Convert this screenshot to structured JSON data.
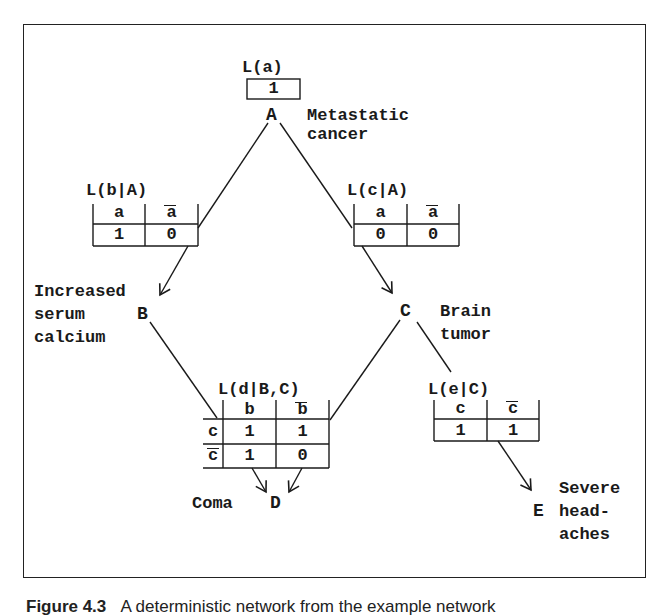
{
  "nodes": {
    "A": {
      "letter": "A",
      "label_lines": [
        "Metastatic",
        "cancer"
      ]
    },
    "B": {
      "letter": "B",
      "label_lines": [
        "Increased",
        "serum",
        "calcium"
      ]
    },
    "C": {
      "letter": "C",
      "label_lines": [
        "Brain",
        "tumor"
      ]
    },
    "D": {
      "letter": "D",
      "label_lines": [
        "Coma"
      ]
    },
    "E": {
      "letter": "E",
      "label_lines": [
        "Severe",
        "head-",
        "aches"
      ]
    }
  },
  "tables": {
    "La": {
      "title": "L(a)",
      "values": [
        "1"
      ]
    },
    "LbA": {
      "title": "L(b|A)",
      "headers": [
        "a",
        "a"
      ],
      "values": [
        "1",
        "0"
      ]
    },
    "LcA": {
      "title": "L(c|A)",
      "headers": [
        "a",
        "a"
      ],
      "values": [
        "0",
        "0"
      ]
    },
    "LdBC": {
      "title": "L(d|B,C)",
      "col_headers": [
        "b",
        "b"
      ],
      "rows": [
        {
          "row_header": "c",
          "values": [
            "1",
            "1"
          ]
        },
        {
          "row_header": "c",
          "values": [
            "1",
            "0"
          ]
        }
      ]
    },
    "LeC": {
      "title": "L(e|C)",
      "headers": [
        "c",
        "c"
      ],
      "values": [
        "1",
        "1"
      ]
    }
  },
  "edges": [
    {
      "from": "A",
      "to": "B"
    },
    {
      "from": "A",
      "to": "C"
    },
    {
      "from": "B",
      "to": "D"
    },
    {
      "from": "C",
      "to": "D"
    },
    {
      "from": "C",
      "to": "E"
    }
  ],
  "caption": {
    "figure_label": "Figure 4.3",
    "text": "A deterministic network from the example network"
  }
}
